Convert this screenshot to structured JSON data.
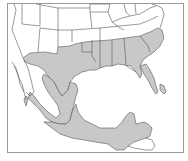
{
  "map": {
    "type": "range-map",
    "region_shown": "Southern United States, Mexico and northern Central America",
    "colors": {
      "background": "#ffffff",
      "land": "#ffffff",
      "range_fill": "#c8c8c8",
      "borders": "#555555",
      "frame": "#9a9a9a"
    },
    "legend": [],
    "labels": []
  }
}
